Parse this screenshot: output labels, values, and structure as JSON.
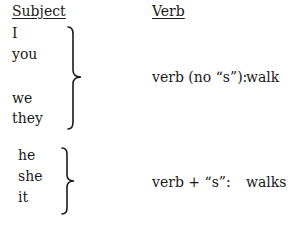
{
  "headers": {
    "subject": "Subject",
    "verb": "Verb"
  },
  "groups": [
    {
      "subjects": [
        "I",
        "you",
        "we",
        "they"
      ],
      "rule": "verb (no “s”):",
      "example": "walk"
    },
    {
      "subjects": [
        "he",
        "she",
        "it"
      ],
      "rule": "verb + “s”:",
      "example": "walks"
    }
  ]
}
